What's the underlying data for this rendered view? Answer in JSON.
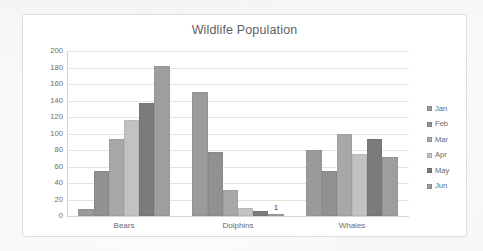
{
  "chart_data": {
    "type": "bar",
    "title": "Wildlife Population",
    "xlabel": "",
    "ylabel": "",
    "categories": [
      "Bears",
      "Dolphins",
      "Whales"
    ],
    "series": [
      {
        "name": "Jan",
        "values": [
          8,
          150,
          80
        ],
        "color": "#9a9a9a"
      },
      {
        "name": "Feb",
        "values": [
          54,
          77,
          54
        ],
        "color": "#919191"
      },
      {
        "name": "Mar",
        "values": [
          93,
          32,
          100
        ],
        "color": "#a8a8a8"
      },
      {
        "name": "Apr",
        "values": [
          116,
          10,
          75
        ],
        "color": "#c2c2c2"
      },
      {
        "name": "May",
        "values": [
          137,
          6,
          93
        ],
        "color": "#7b7b7b"
      },
      {
        "name": "Jun",
        "values": [
          182,
          1,
          72
        ],
        "color": "#9e9e9e"
      }
    ],
    "ylim": [
      0,
      200
    ],
    "y_ticks": [
      0,
      20,
      40,
      60,
      80,
      100,
      120,
      140,
      160,
      180,
      200
    ],
    "y_tick_labels": [
      "0",
      "20",
      "40",
      "60",
      "80",
      "100",
      "120",
      "140",
      "160",
      "180",
      "200"
    ],
    "grid": true,
    "grid_axis": "y",
    "legend": true,
    "legend_position": "right",
    "legend_entries": [
      "Jan",
      "Feb",
      "Mar",
      "Apr",
      "May",
      "Jun"
    ],
    "data_labels": [
      {
        "category": "Dolphins",
        "series": "Jun",
        "value": 1,
        "text": "1"
      }
    ],
    "colors": {
      "plot_background": "#ffffff",
      "frame_border": "#dcdcdc",
      "gridline": "#e3e3e3",
      "axis_line": "#d2d2d2",
      "title_text": "#5f5f5f",
      "tick_text": "#6d6d6d",
      "legend_text": "#6a6a6a"
    }
  }
}
